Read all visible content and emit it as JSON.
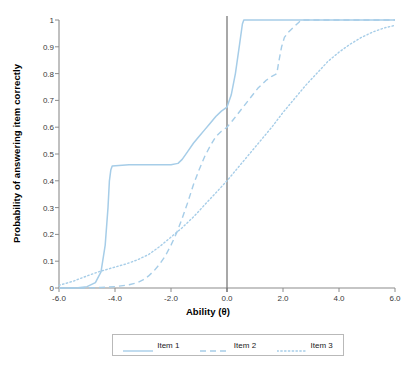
{
  "chart_data": {
    "type": "line",
    "title": "",
    "xlabel": "Ability (θ)",
    "ylabel": "Probability of answering item correctly",
    "xlim": [
      -6.0,
      6.0
    ],
    "ylim": [
      0,
      1
    ],
    "xticks": [
      "-6.0",
      "-4.0",
      "-2.0",
      "0.0",
      "2.0",
      "4.0",
      "6.0"
    ],
    "xtick_values": [
      -6.0,
      -4.0,
      -2.0,
      0.0,
      2.0,
      4.0,
      6.0
    ],
    "yticks": [
      "0",
      "0.1",
      "0.2",
      "0.3",
      "0.4",
      "0.5",
      "0.6",
      "0.7",
      "0.8",
      "0.9",
      "1"
    ],
    "ytick_values": [
      0,
      0.1,
      0.2,
      0.3,
      0.4,
      0.5,
      0.6,
      0.7,
      0.8,
      0.9,
      1.0
    ],
    "grid": false,
    "legend_position": "bottom",
    "accent_color": "#a6cde8",
    "axis_color": "#8c8c8c",
    "reference_line": {
      "axis": "x",
      "value": 0.0,
      "color": "#6e6e6e"
    },
    "series": [
      {
        "name": "Item 1",
        "style": "solid",
        "color": "#a6cde8",
        "x": [
          -6.0,
          -5.4,
          -5.0,
          -4.7,
          -4.5,
          -4.35,
          -4.25,
          -4.2,
          -4.15,
          -4.1,
          -3.5,
          -3.0,
          -2.5,
          -2.0,
          -1.75,
          -1.6,
          -1.4,
          -1.2,
          -1.0,
          -0.8,
          -0.6,
          -0.4,
          -0.2,
          0.0,
          0.15,
          0.3,
          0.45,
          0.55,
          0.6,
          1.0,
          2.0,
          3.0,
          4.0,
          5.0,
          6.0
        ],
        "y": [
          0.0,
          0.0,
          0.005,
          0.02,
          0.06,
          0.16,
          0.3,
          0.4,
          0.44,
          0.455,
          0.46,
          0.46,
          0.46,
          0.46,
          0.465,
          0.48,
          0.51,
          0.54,
          0.565,
          0.59,
          0.615,
          0.64,
          0.66,
          0.675,
          0.72,
          0.8,
          0.91,
          0.985,
          1.0,
          1.0,
          1.0,
          1.0,
          1.0,
          1.0,
          1.0
        ]
      },
      {
        "name": "Item 2",
        "style": "dashed",
        "color": "#a6cde8",
        "x": [
          -6.0,
          -5.0,
          -4.5,
          -4.0,
          -3.5,
          -3.2,
          -3.0,
          -2.8,
          -2.6,
          -2.4,
          -2.2,
          -2.0,
          -1.8,
          -1.6,
          -1.4,
          -1.2,
          -1.0,
          -0.8,
          -0.6,
          -0.4,
          -0.2,
          0.0,
          0.2,
          0.5,
          0.8,
          1.1,
          1.4,
          1.6,
          1.7,
          1.78,
          1.85,
          1.95,
          2.05,
          2.2,
          2.4,
          2.55,
          2.65,
          3.0,
          4.0,
          5.0,
          6.0
        ],
        "y": [
          0.0,
          0.0,
          0.002,
          0.005,
          0.012,
          0.02,
          0.03,
          0.045,
          0.065,
          0.09,
          0.12,
          0.16,
          0.205,
          0.26,
          0.32,
          0.385,
          0.44,
          0.49,
          0.53,
          0.565,
          0.585,
          0.6,
          0.625,
          0.665,
          0.705,
          0.745,
          0.775,
          0.79,
          0.795,
          0.8,
          0.845,
          0.9,
          0.935,
          0.955,
          0.975,
          0.99,
          1.0,
          1.0,
          1.0,
          1.0,
          1.0
        ]
      },
      {
        "name": "Item 3",
        "style": "dotted",
        "color": "#a6cde8",
        "x": [
          -6.0,
          -5.5,
          -5.0,
          -4.6,
          -4.2,
          -4.0,
          -3.6,
          -3.2,
          -2.8,
          -2.4,
          -2.0,
          -1.6,
          -1.2,
          -0.8,
          -0.4,
          0.0,
          0.4,
          0.8,
          1.2,
          1.6,
          2.0,
          2.4,
          2.8,
          3.2,
          3.6,
          4.0,
          4.4,
          4.8,
          5.2,
          5.6,
          6.0
        ],
        "y": [
          0.01,
          0.025,
          0.045,
          0.06,
          0.072,
          0.078,
          0.09,
          0.105,
          0.125,
          0.155,
          0.19,
          0.225,
          0.265,
          0.31,
          0.355,
          0.4,
          0.45,
          0.5,
          0.55,
          0.6,
          0.655,
          0.705,
          0.755,
          0.8,
          0.845,
          0.88,
          0.91,
          0.935,
          0.955,
          0.97,
          0.98
        ]
      }
    ]
  },
  "legend": {
    "items": [
      {
        "label": "Item 1",
        "style": "solid"
      },
      {
        "label": "Item 2",
        "style": "dashed"
      },
      {
        "label": "Item 3",
        "style": "dotted"
      }
    ]
  }
}
